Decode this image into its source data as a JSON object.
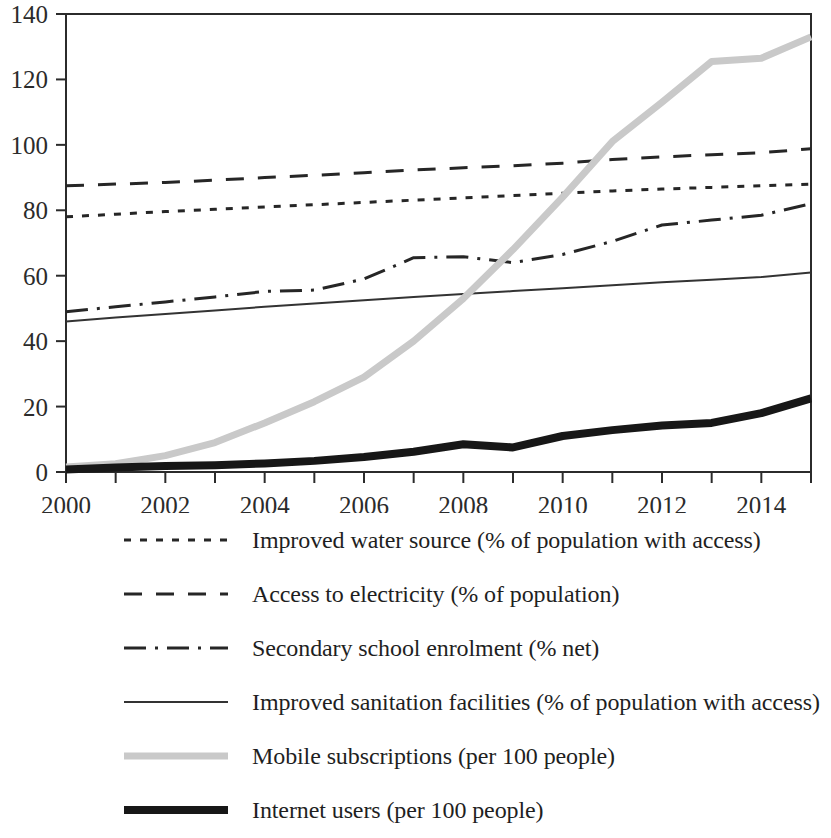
{
  "chart_data": {
    "type": "line",
    "title": "",
    "xlabel": "",
    "ylabel": "",
    "xlim": [
      2000,
      2015
    ],
    "ylim": [
      0,
      140
    ],
    "y_ticks": [
      0,
      20,
      40,
      60,
      80,
      100,
      120,
      140
    ],
    "x_ticks": [
      2000,
      2001,
      2002,
      2003,
      2004,
      2005,
      2006,
      2007,
      2008,
      2009,
      2010,
      2011,
      2012,
      2013,
      2014,
      2015
    ],
    "x_tick_labels": [
      "2000",
      "",
      "2002",
      "",
      "2004",
      "",
      "2006",
      "",
      "2008",
      "",
      "2010",
      "",
      "2012",
      "",
      "2014",
      ""
    ],
    "y_tick_labels": [
      "0",
      "20",
      "40",
      "60",
      "80",
      "100",
      "120",
      "140"
    ],
    "grid": false,
    "legend_position": "bottom",
    "x": [
      2000,
      2001,
      2002,
      2003,
      2004,
      2005,
      2006,
      2007,
      2008,
      2009,
      2010,
      2011,
      2012,
      2013,
      2014,
      2015
    ],
    "series": [
      {
        "name": "Improved water source (% of population with access)",
        "dash": "dotted",
        "color": "#262626",
        "width": 3,
        "values": [
          78.0,
          78.8,
          79.6,
          80.3,
          81.0,
          81.7,
          82.4,
          83.1,
          83.8,
          84.5,
          85.2,
          85.9,
          86.5,
          87.0,
          87.5,
          88.0
        ]
      },
      {
        "name": "Access to electricity (% of population)",
        "dash": "dashed",
        "color": "#262626",
        "width": 3,
        "values": [
          87.5,
          88.0,
          88.5,
          89.2,
          90.0,
          90.7,
          91.5,
          92.3,
          93.0,
          93.6,
          94.4,
          95.5,
          96.3,
          97.0,
          97.6,
          98.8
        ]
      },
      {
        "name": "Secondary school enrolment (% net)",
        "dash": "dashdot",
        "color": "#262626",
        "width": 3,
        "values": [
          49.0,
          50.5,
          52.0,
          53.5,
          55.2,
          55.6,
          59.0,
          65.5,
          65.8,
          64.0,
          66.5,
          70.5,
          75.5,
          77.0,
          78.5,
          82.0
        ]
      },
      {
        "name": "Improved sanitation facilities (% of population with access)",
        "dash": "solid",
        "color": "#333333",
        "width": 2,
        "values": [
          46.0,
          47.2,
          48.3,
          49.4,
          50.5,
          51.5,
          52.5,
          53.5,
          54.4,
          55.3,
          56.2,
          57.1,
          58.0,
          58.8,
          59.6,
          61.0
        ]
      },
      {
        "name": "Mobile subscriptions (per 100 people)",
        "dash": "solid",
        "color": "#c9c9c9",
        "width": 7,
        "values": [
          1.5,
          2.5,
          5.0,
          9.0,
          15.0,
          21.5,
          29.0,
          40.0,
          53.0,
          68.0,
          84.0,
          101.0,
          113.0,
          125.5,
          126.5,
          133.0
        ]
      },
      {
        "name": "Internet users (per 100 people)",
        "dash": "solid",
        "color": "#171717",
        "width": 8,
        "values": [
          0.8,
          1.4,
          1.8,
          2.1,
          2.6,
          3.4,
          4.6,
          6.2,
          8.5,
          7.5,
          11.0,
          12.8,
          14.2,
          15.0,
          18.0,
          22.5
        ]
      }
    ]
  },
  "legend": {
    "entries": [
      {
        "label": "Improved water source (% of population with access)",
        "style": "dotted"
      },
      {
        "label": "Access to electricity (% of population)",
        "style": "dashed"
      },
      {
        "label": "Secondary school enrolment (% net)",
        "style": "dashdot"
      },
      {
        "label": "Improved sanitation facilities (% of population with access)",
        "style": "solid-thin"
      },
      {
        "label": "Mobile subscriptions (per 100 people)",
        "style": "solid-gray-thick"
      },
      {
        "label": "Internet users (per 100 people)",
        "style": "solid-black-thick"
      }
    ]
  }
}
